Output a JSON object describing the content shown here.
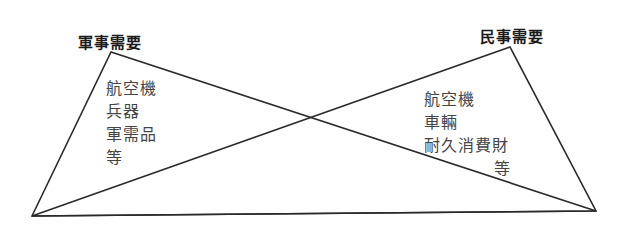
{
  "diagram": {
    "military": {
      "title": "軍事需要",
      "items": [
        "航空機",
        "兵器",
        "軍需品",
        "等"
      ]
    },
    "civilian": {
      "title": "民事需要",
      "items": [
        "航空機",
        "車輛",
        "耐久消費財",
        "等"
      ]
    },
    "line_color": "#2a2a2a"
  }
}
